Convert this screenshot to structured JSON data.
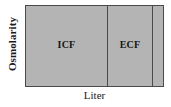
{
  "figure": {
    "type": "fluid-compartment-diagram",
    "y_axis_label": "Osmolarity",
    "x_axis_label": "Liter",
    "fill_color": "#b4b4b4",
    "border_color": "#4a4a4a",
    "background_color": "#ffffff"
  },
  "compartments": [
    {
      "id": "icf",
      "label": "ICF",
      "width_fraction": 0.583
    },
    {
      "id": "ecf",
      "label": "ECF",
      "width_fraction": 0.324
    },
    {
      "id": "third-space",
      "label": "",
      "width_fraction": 0.093
    }
  ],
  "chart_data": {
    "type": "bar",
    "title": "",
    "xlabel": "Liter",
    "ylabel": "Osmolarity",
    "categories": [
      "ICF",
      "ECF",
      ""
    ],
    "values": [
      1,
      1,
      1
    ],
    "widths": [
      81,
      45,
      12
    ],
    "grid": false,
    "legend": "none"
  }
}
